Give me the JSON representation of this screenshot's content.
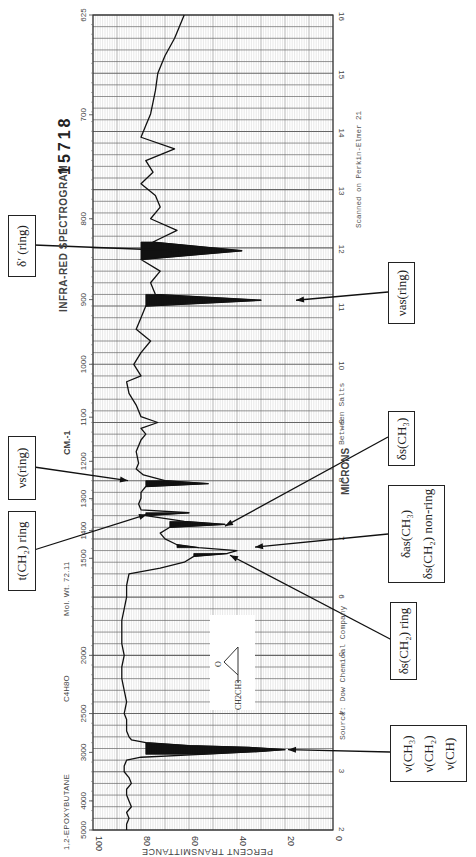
{
  "header": {
    "title": "INFRA-RED SPECTROGRAM",
    "number": "15718",
    "compound": "1,2-EPOXYBUTANE",
    "formula": "C4H8O",
    "mol_wt": "Mol. Wt. 72.11",
    "scanned": "Scanned on Perkin-Elmer 21",
    "source": "Source: Dow Chemical Company",
    "phase": "Between Salts",
    "structure_label": "CH2CH3",
    "structure_atom": "O"
  },
  "axes": {
    "transmittance_label": "PERCENT TRANSMITTANCE",
    "transmittance_ticks": [
      "100",
      "80",
      "60",
      "40",
      "20",
      "0"
    ],
    "micron_label": "MICRONS",
    "micron_ticks": [
      "2",
      "3",
      "4",
      "5",
      "6",
      "7",
      "8",
      "9",
      "10",
      "11",
      "12",
      "13",
      "14",
      "15",
      "16"
    ],
    "wavenumber_label": "CM.-1",
    "wavenumber_ticks": [
      {
        "label": "5000",
        "um": 2.0
      },
      {
        "label": "4000",
        "um": 2.5
      },
      {
        "label": "3000",
        "um": 3.333
      },
      {
        "label": "2500",
        "um": 4.0
      },
      {
        "label": "2000",
        "um": 5.0
      },
      {
        "label": "1500",
        "um": 6.667
      },
      {
        "label": "1400",
        "um": 7.143
      },
      {
        "label": "1300",
        "um": 7.692
      },
      {
        "label": "1200",
        "um": 8.333
      },
      {
        "label": "1100",
        "um": 9.091
      },
      {
        "label": "1000",
        "um": 10.0
      },
      {
        "label": "900",
        "um": 11.111
      },
      {
        "label": "800",
        "um": 12.5
      },
      {
        "label": "700",
        "um": 14.286
      },
      {
        "label": "625",
        "um": 16.0
      }
    ]
  },
  "annotations": [
    {
      "id": "nu-ch",
      "lines": [
        "ν(CH₃)",
        "ν(CH₂)",
        "ν(CH)"
      ],
      "target_um": 3.38
    },
    {
      "id": "delta-s-ch2-ring",
      "lines": [
        "δs(CH₂) ring"
      ],
      "target_um": 6.72
    },
    {
      "id": "delta-as-ch3",
      "lines": [
        "δas(CH₃)",
        "δs(CH₂) non-ring"
      ],
      "target_um": 6.86
    },
    {
      "id": "delta-s-ch3",
      "lines": [
        "δs(CH₃)"
      ],
      "target_um": 7.25
    },
    {
      "id": "t-ch2-ring",
      "lines": [
        "t(CH₂) ring"
      ],
      "target_um": 7.42
    },
    {
      "id": "nu-s-ring",
      "lines": [
        "νs(ring)"
      ],
      "target_um": 7.95
    },
    {
      "id": "nu-as-ring",
      "lines": [
        "νas(ring)"
      ],
      "target_um": 11.1
    },
    {
      "id": "delta-prime-ring",
      "lines": [
        "δ′ (ring)"
      ],
      "target_um": 11.95
    }
  ],
  "chart_data": {
    "type": "line",
    "xlabel": "MICRONS",
    "ylabel": "PERCENT TRANSMITTANCE",
    "xlim": [
      2,
      16
    ],
    "ylim": [
      0,
      100
    ],
    "orientation": "rotated 90° (wavelength runs vertically, transmittance horizontally reversed)",
    "grid": true,
    "series": [
      {
        "name": "1,2-epoxybutane transmittance",
        "x": [
          2.0,
          2.1,
          2.2,
          2.3,
          2.4,
          2.5,
          2.6,
          2.7,
          2.8,
          2.9,
          3.0,
          3.1,
          3.2,
          3.25,
          3.3,
          3.35,
          3.38,
          3.42,
          3.45,
          3.5,
          3.55,
          3.6,
          3.7,
          3.8,
          3.9,
          4.0,
          4.2,
          4.4,
          4.6,
          4.8,
          5.0,
          5.2,
          5.4,
          5.6,
          5.8,
          6.0,
          6.2,
          6.4,
          6.5,
          6.6,
          6.7,
          6.75,
          6.8,
          6.85,
          6.9,
          7.0,
          7.1,
          7.2,
          7.25,
          7.3,
          7.4,
          7.45,
          7.5,
          7.6,
          7.7,
          7.8,
          7.9,
          7.95,
          8.0,
          8.1,
          8.2,
          8.3,
          8.5,
          8.7,
          8.8,
          8.9,
          9.0,
          9.1,
          9.3,
          9.5,
          9.7,
          9.8,
          10.0,
          10.2,
          10.4,
          10.6,
          10.8,
          11.0,
          11.1,
          11.2,
          11.4,
          11.6,
          11.8,
          11.95,
          12.1,
          12.3,
          12.5,
          12.7,
          12.9,
          13.1,
          13.3,
          13.5,
          13.7,
          13.9,
          14.1,
          14.3,
          14.5,
          14.7,
          15.0,
          15.3,
          15.6,
          16.0
        ],
        "y": [
          86,
          86,
          85,
          86,
          84,
          85,
          86,
          86,
          84,
          85,
          87,
          87,
          86,
          80,
          55,
          30,
          20,
          35,
          60,
          78,
          84,
          85,
          86,
          86,
          86,
          87,
          86,
          87,
          88,
          88,
          87,
          88,
          88,
          88,
          87,
          86,
          86,
          85,
          72,
          62,
          58,
          44,
          40,
          56,
          65,
          70,
          72,
          68,
          45,
          62,
          78,
          60,
          80,
          81,
          80,
          80,
          78,
          52,
          70,
          79,
          82,
          81,
          82,
          80,
          78,
          80,
          73,
          80,
          82,
          85,
          86,
          80,
          83,
          80,
          76,
          82,
          80,
          78,
          30,
          74,
          76,
          72,
          80,
          38,
          75,
          65,
          76,
          72,
          74,
          80,
          75,
          78,
          66,
          80,
          78,
          76,
          75,
          74,
          73,
          70,
          66,
          62
        ]
      }
    ],
    "filled_absorption_bands_um": [
      [
        3.3,
        3.5
      ],
      [
        6.65,
        6.75
      ],
      [
        6.82,
        6.92
      ],
      [
        7.2,
        7.3
      ],
      [
        7.4,
        7.48
      ],
      [
        7.85,
        8.05
      ],
      [
        10.85,
        11.3
      ],
      [
        11.8,
        12.1
      ]
    ]
  }
}
